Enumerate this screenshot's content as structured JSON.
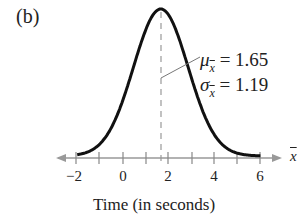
{
  "panel": {
    "label": "(b)"
  },
  "annotation": {
    "mean_symbol": "μ",
    "mean_sub": "x",
    "mean_text": " = 1.65",
    "sd_symbol": "σ",
    "sd_sub": "x",
    "sd_text": " = 1.19"
  },
  "axis": {
    "variable": "x",
    "ticks": [
      "−2",
      "0",
      "2",
      "4",
      "6"
    ]
  },
  "xlabel": "Time (in seconds)",
  "chart_data": {
    "type": "line",
    "title": "(b)",
    "xlabel": "Time (in seconds)",
    "ylabel": "",
    "x_variable": "x̄",
    "xlim": [
      -2.5,
      6.8
    ],
    "xticks_major": [
      -2,
      0,
      2,
      4,
      6
    ],
    "xticks_minor": [
      -2,
      -1,
      0,
      1,
      2,
      3,
      4,
      5,
      6
    ],
    "distribution": "normal",
    "mean": 1.65,
    "std": 1.19,
    "annotations": [
      "μ_x̄ = 1.65",
      "σ_x̄ = 1.19"
    ],
    "mean_line": {
      "x": 1.65,
      "style": "dashed"
    },
    "grid": false,
    "legend": null
  }
}
